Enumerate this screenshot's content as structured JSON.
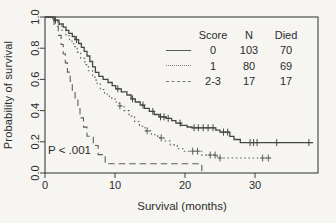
{
  "colors": {
    "background": "#f6f5f1",
    "axis": "#3f3f3f",
    "curve_solid": "#474747",
    "curve_dotted": "#5c5c5c",
    "curve_dashed": "#5c5c5c",
    "text": "#2b2b2b"
  },
  "chart_data": {
    "type": "line",
    "subtype": "kaplan-meier-step-survival",
    "title": "",
    "xlabel": "Survival (months)",
    "ylabel": "Probability of survival",
    "annotation": "P < .001",
    "xlim": [
      0,
      39
    ],
    "ylim": [
      0.0,
      1.0
    ],
    "grid": false,
    "x_ticks": [
      {
        "value": 0,
        "label": "0"
      },
      {
        "value": 10,
        "label": "10"
      },
      {
        "value": 20,
        "label": "20"
      },
      {
        "value": 30,
        "label": "30"
      }
    ],
    "y_ticks": [
      {
        "value": 0.0,
        "label": "0.0"
      },
      {
        "value": 0.2,
        "label": "0.2"
      },
      {
        "value": 0.4,
        "label": "0.4"
      },
      {
        "value": 0.6,
        "label": "0.6"
      },
      {
        "value": 0.8,
        "label": "0.8"
      },
      {
        "value": 1.0,
        "label": "1.0"
      }
    ],
    "legend": {
      "position": "top-right-inside",
      "columns": [
        "Score",
        "N",
        "Died"
      ],
      "rows": [
        {
          "score": "0",
          "n": "103",
          "died": "70",
          "line_style": "solid"
        },
        {
          "score": "1",
          "n": "80",
          "died": "69",
          "line_style": "dotted"
        },
        {
          "score": "2-3",
          "n": "17",
          "died": "17",
          "line_style": "dashed"
        }
      ]
    },
    "series": [
      {
        "name": "Score 0",
        "style": "solid",
        "points": [
          [
            0,
            1.0
          ],
          [
            1.3,
            0.98
          ],
          [
            2.0,
            0.955
          ],
          [
            2.6,
            0.935
          ],
          [
            3.0,
            0.915
          ],
          [
            3.4,
            0.895
          ],
          [
            3.9,
            0.875
          ],
          [
            4.3,
            0.855
          ],
          [
            4.8,
            0.83
          ],
          [
            5.2,
            0.805
          ],
          [
            5.6,
            0.78
          ],
          [
            6.0,
            0.75
          ],
          [
            6.4,
            0.715
          ],
          [
            6.8,
            0.68
          ],
          [
            7.2,
            0.645
          ],
          [
            7.7,
            0.62
          ],
          [
            8.3,
            0.6
          ],
          [
            9.0,
            0.58
          ],
          [
            9.6,
            0.56
          ],
          [
            10.1,
            0.54
          ],
          [
            10.9,
            0.52
          ],
          [
            11.7,
            0.5
          ],
          [
            12.3,
            0.475
          ],
          [
            12.9,
            0.455
          ],
          [
            13.6,
            0.435
          ],
          [
            14.2,
            0.415
          ],
          [
            14.9,
            0.395
          ],
          [
            15.6,
            0.375
          ],
          [
            16.3,
            0.36
          ],
          [
            17.3,
            0.35
          ],
          [
            18.1,
            0.335
          ],
          [
            18.7,
            0.32
          ],
          [
            19.4,
            0.305
          ],
          [
            20.3,
            0.295
          ],
          [
            21.0,
            0.29
          ],
          [
            24.4,
            0.275
          ],
          [
            25.0,
            0.262
          ],
          [
            26.4,
            0.235
          ],
          [
            27.0,
            0.215
          ],
          [
            27.9,
            0.195
          ],
          [
            38.3,
            0.195
          ]
        ],
        "censors": [
          [
            1.5,
            0.98
          ],
          [
            4.5,
            0.855
          ],
          [
            10.4,
            0.54
          ],
          [
            12.5,
            0.475
          ],
          [
            14.0,
            0.435
          ],
          [
            15.4,
            0.395
          ],
          [
            16.5,
            0.36
          ],
          [
            17.0,
            0.36
          ],
          [
            17.6,
            0.35
          ],
          [
            19.3,
            0.32
          ],
          [
            21.3,
            0.29
          ],
          [
            21.9,
            0.29
          ],
          [
            22.6,
            0.29
          ],
          [
            23.3,
            0.29
          ],
          [
            24.0,
            0.29
          ],
          [
            25.5,
            0.262
          ],
          [
            26.1,
            0.262
          ],
          [
            29.3,
            0.195
          ],
          [
            29.8,
            0.195
          ],
          [
            30.3,
            0.195
          ],
          [
            33.1,
            0.195
          ],
          [
            37.7,
            0.195
          ]
        ]
      },
      {
        "name": "Score 1",
        "style": "dotted",
        "points": [
          [
            0,
            1.0
          ],
          [
            1.1,
            0.975
          ],
          [
            1.8,
            0.95
          ],
          [
            2.4,
            0.915
          ],
          [
            3.0,
            0.88
          ],
          [
            3.5,
            0.845
          ],
          [
            4.1,
            0.81
          ],
          [
            4.6,
            0.775
          ],
          [
            5.1,
            0.735
          ],
          [
            5.7,
            0.695
          ],
          [
            6.2,
            0.655
          ],
          [
            6.8,
            0.615
          ],
          [
            7.3,
            0.575
          ],
          [
            7.9,
            0.535
          ],
          [
            8.5,
            0.505
          ],
          [
            9.2,
            0.48
          ],
          [
            10.0,
            0.455
          ],
          [
            10.6,
            0.43
          ],
          [
            11.3,
            0.4
          ],
          [
            12.0,
            0.365
          ],
          [
            12.8,
            0.33
          ],
          [
            13.5,
            0.3
          ],
          [
            14.3,
            0.27
          ],
          [
            15.2,
            0.245
          ],
          [
            16.1,
            0.225
          ],
          [
            17.0,
            0.205
          ],
          [
            17.9,
            0.18
          ],
          [
            18.9,
            0.155
          ],
          [
            19.8,
            0.14
          ],
          [
            22.4,
            0.115
          ],
          [
            24.6,
            0.096
          ],
          [
            32.4,
            0.096
          ]
        ],
        "censors": [
          [
            10.7,
            0.43
          ],
          [
            14.6,
            0.27
          ],
          [
            16.6,
            0.225
          ],
          [
            21.1,
            0.14
          ],
          [
            21.8,
            0.14
          ],
          [
            23.6,
            0.115
          ],
          [
            24.3,
            0.115
          ],
          [
            25.0,
            0.096
          ],
          [
            31.1,
            0.096
          ],
          [
            31.9,
            0.096
          ]
        ]
      },
      {
        "name": "Score 2-3",
        "style": "dashed",
        "points": [
          [
            0,
            1.0
          ],
          [
            1.3,
            0.941
          ],
          [
            1.9,
            0.882
          ],
          [
            2.3,
            0.824
          ],
          [
            2.6,
            0.765
          ],
          [
            2.9,
            0.706
          ],
          [
            3.2,
            0.647
          ],
          [
            3.6,
            0.588
          ],
          [
            3.9,
            0.529
          ],
          [
            4.3,
            0.471
          ],
          [
            4.7,
            0.412
          ],
          [
            5.0,
            0.353
          ],
          [
            5.5,
            0.294
          ],
          [
            6.0,
            0.235
          ],
          [
            6.9,
            0.176
          ],
          [
            7.6,
            0.118
          ],
          [
            8.6,
            0.059
          ],
          [
            22.4,
            0.0
          ]
        ],
        "censors": []
      }
    ]
  }
}
